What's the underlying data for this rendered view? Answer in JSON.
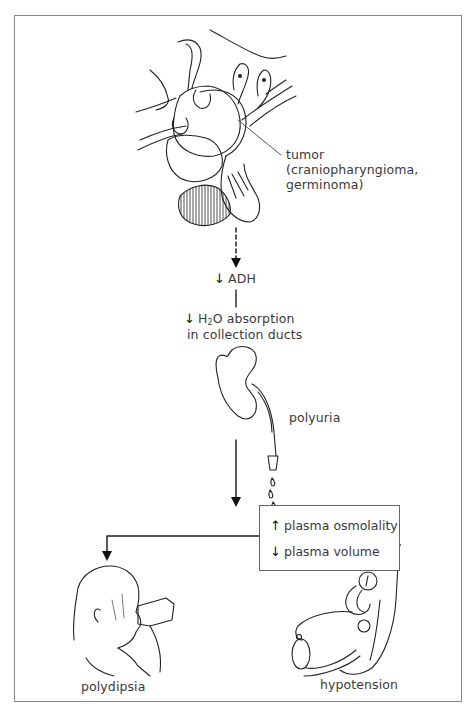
{
  "figure": {
    "tumor_label": {
      "line1": "tumor",
      "line2": "(craniopharyngioma,",
      "line3": "germinoma)"
    },
    "steps": {
      "adh": {
        "direction": "down",
        "arrow": "↓",
        "label": "ADH"
      },
      "h2o": {
        "direction": "down",
        "arrow": "↓",
        "label_prefix": "H",
        "subscript": "2",
        "label_suffix": "O absorption",
        "line2": "in collection ducts"
      },
      "kidney_label": "polyuria",
      "box": {
        "row1": {
          "direction": "up",
          "arrow": "↑",
          "label": "plasma osmolality"
        },
        "row2": {
          "direction": "down",
          "arrow": "↓",
          "label": "plasma volume"
        }
      },
      "left_outcome": "polydipsia",
      "right_outcome": "hypotension"
    },
    "illustrations": [
      "pituitary-tumor-illustration",
      "kidney-ureter-illustration",
      "child-drinking-illustration",
      "blood-pressure-cuff-illustration"
    ]
  }
}
